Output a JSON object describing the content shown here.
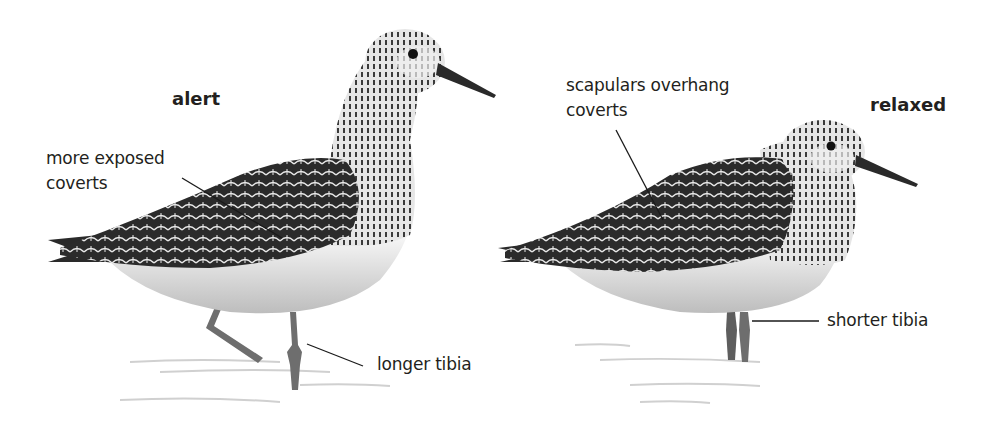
{
  "figure": {
    "panels": [
      {
        "id": "alert",
        "title": "alert",
        "annotations": [
          {
            "text_lines": [
              "more exposed",
              "coverts"
            ],
            "target": "wing coverts"
          },
          {
            "text_lines": [
              "longer tibia"
            ],
            "target": "leg tibia"
          }
        ]
      },
      {
        "id": "relaxed",
        "title": "relaxed",
        "annotations": [
          {
            "text_lines": [
              "scapulars overhang",
              "coverts"
            ],
            "target": "scapulars"
          },
          {
            "text_lines": [
              "shorter tibia"
            ],
            "target": "leg tibia"
          }
        ]
      }
    ]
  },
  "colors": {
    "background": "#ffffff",
    "text": "#231f20",
    "leader_line": "#1a1a1a",
    "plumage_dark": "#2a2a2a",
    "plumage_mid": "#7a7a7a",
    "belly": "#f2f2f2",
    "water": "#d8d8d8"
  }
}
